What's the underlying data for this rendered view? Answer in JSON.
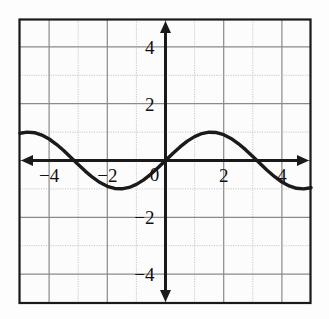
{
  "figure": {
    "title": ""
  },
  "chart_data": {
    "type": "line",
    "title": "",
    "xlabel": "",
    "ylabel": "",
    "function": "y = sin(x)",
    "xlim": [
      -5,
      5
    ],
    "ylim": [
      -4.9,
      4.9
    ],
    "grid": true,
    "legend": null,
    "amplitude": 1,
    "period": 6.283,
    "x_tick_labels": [
      "-4",
      "-2",
      "0",
      "2",
      "4"
    ],
    "x_tick_values": [
      -4,
      -2,
      0,
      2,
      4
    ],
    "y_tick_labels": [
      "4",
      "2",
      "-2",
      "-4"
    ],
    "y_tick_values": [
      4,
      2,
      -2,
      -4
    ],
    "x": [
      -5,
      -4.75,
      -4.5,
      -4.25,
      -4,
      -3.75,
      -3.5,
      -3.25,
      -3,
      -2.75,
      -2.5,
      -2.25,
      -2,
      -1.75,
      -1.5,
      -1.25,
      -1,
      -0.75,
      -0.5,
      -0.25,
      0,
      0.25,
      0.5,
      0.75,
      1,
      1.25,
      1.5,
      1.75,
      2,
      2.25,
      2.5,
      2.75,
      3,
      3.25,
      3.5,
      3.75,
      4,
      4.25,
      4.5,
      4.75,
      5
    ],
    "y": [
      0.959,
      0.999,
      0.978,
      0.895,
      0.757,
      0.572,
      0.351,
      0.108,
      -0.141,
      -0.382,
      -0.598,
      -0.778,
      -0.909,
      -0.984,
      -0.997,
      -0.949,
      -0.841,
      -0.682,
      -0.479,
      -0.247,
      0,
      0.247,
      0.479,
      0.682,
      0.841,
      0.949,
      0.997,
      0.984,
      0.909,
      0.778,
      0.598,
      0.382,
      0.141,
      -0.108,
      -0.351,
      -0.572,
      -0.757,
      -0.895,
      -0.978,
      -0.999,
      -0.959
    ],
    "colors": {
      "curve": "#1a1a1a",
      "axis": "#1a1a1a",
      "grid_major": "#8a8a8a",
      "grid_minor": "#b8b8b8",
      "frame": "#1a1a1a",
      "background": "#fdfdfd"
    }
  },
  "axes": {
    "x_axis_label": "x-axis",
    "y_axis_label": "y-axis"
  }
}
